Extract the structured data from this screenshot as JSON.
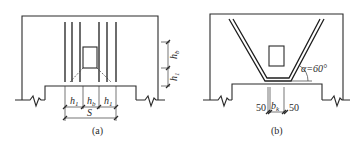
{
  "figure": {
    "panels": [
      {
        "id": "a",
        "caption": "(a)",
        "dimensions": {
          "h1_left": "h",
          "h1_left_sub": "1",
          "hb": "h",
          "hb_sub": "b",
          "h1_right": "h",
          "h1_right_sub": "1",
          "span": "S"
        },
        "vertical_dims": {
          "upper": "h",
          "upper_sub": "b",
          "lower": "h",
          "lower_sub": "1"
        }
      },
      {
        "id": "b",
        "caption": "(b)",
        "angle_label": "α=60°",
        "dimensions": {
          "left_offset": "50",
          "width": "b",
          "width_sub": "k",
          "right_offset": "50"
        }
      }
    ],
    "colors": {
      "line": "#2a2a2a",
      "background": "#ffffff"
    }
  }
}
